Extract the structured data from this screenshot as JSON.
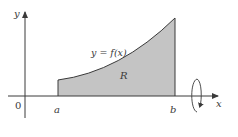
{
  "figure": {
    "type": "solid-of-revolution-diagram",
    "colors": {
      "axis": "#3a3a3a",
      "curve": "#3a3a3a",
      "region_fill": "#c4c4c4",
      "background": "#ffffff"
    },
    "labels": {
      "y_axis": "y",
      "x_axis": "x",
      "origin": "0",
      "a": "a",
      "b": "b",
      "curve": "y = f(x)",
      "region": "R"
    },
    "rotation_axis": "x",
    "icons": {
      "rotation": "rotation-arrow-icon"
    }
  }
}
